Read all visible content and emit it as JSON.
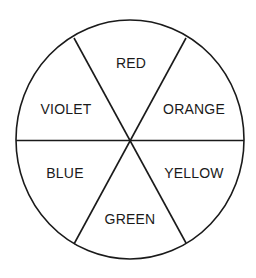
{
  "diagram": {
    "type": "color-wheel",
    "center": {
      "x": 130,
      "y": 140
    },
    "radius": {
      "rx": 114,
      "ry": 119
    },
    "stroke_color": "#1a1a1a",
    "background_color": "#ffffff",
    "segments": [
      {
        "label": "RED",
        "x": 131,
        "y": 68
      },
      {
        "label": "ORANGE",
        "x": 194,
        "y": 114
      },
      {
        "label": "YELLOW",
        "x": 194,
        "y": 178
      },
      {
        "label": "GREEN",
        "x": 130,
        "y": 224
      },
      {
        "label": "BLUE",
        "x": 65,
        "y": 178
      },
      {
        "label": "VIOLET",
        "x": 66,
        "y": 114
      }
    ]
  }
}
